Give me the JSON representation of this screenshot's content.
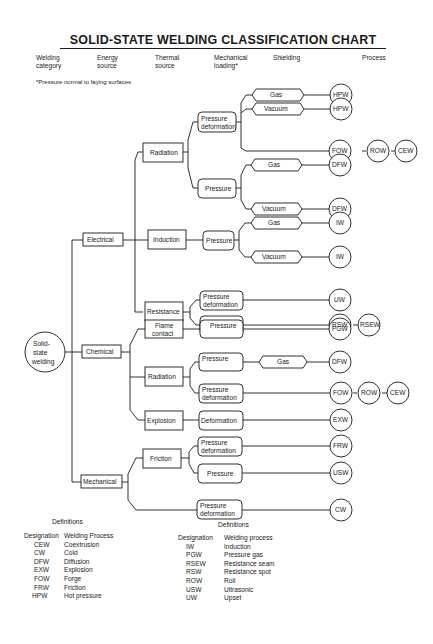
{
  "title": "SOLID-STATE WELDING CLASSIFICATION CHART",
  "column_headers": [
    {
      "line1": "Welding",
      "line2": "category"
    },
    {
      "line1": "Energy",
      "line2": "source"
    },
    {
      "line1": "Thermal",
      "line2": "source"
    },
    {
      "line1": "Mechanical",
      "line2": "loading*"
    },
    {
      "line1": "Shielding",
      "line2": ""
    },
    {
      "line1": "Process",
      "line2": ""
    }
  ],
  "footnote": "*Pressure normal to faying surfaces",
  "tree": {
    "root": {
      "line1": "Solid-",
      "line2": "state",
      "line3": "welding"
    },
    "categories": [
      "Electrical",
      "Chemical",
      "Mechanical"
    ],
    "sources": {
      "radiation": "Radiation",
      "induction": "Induction",
      "resistance": "Resistance",
      "flame_l1": "Flame",
      "flame_l2": "contact",
      "radiation2": "Radiation",
      "explosion": "Explosion",
      "friction": "Friction"
    },
    "loading": {
      "pd_l1": "Pressure",
      "pd_l2": "deformation",
      "pressure": "Pressure",
      "deformation": "Deformation"
    },
    "shielding": {
      "gas": "Gas",
      "vacuum": "Vacuum"
    },
    "processes": {
      "hpw": "HPW",
      "fow": "FOW",
      "row": "ROW",
      "cew": "CEW",
      "dfw": "DFW",
      "iw": "IW",
      "uw": "UW",
      "rsw": "RSW",
      "rsew": "RSEW",
      "pgw": "PGW",
      "exw": "EXW",
      "frw": "FRW",
      "usw": "USW",
      "cw": "CW"
    }
  },
  "definitions_left": {
    "title": "Definitions",
    "col1": "Designation",
    "col2": "Welding Process",
    "rows": [
      {
        "code": "CEW",
        "name": "Coextrusion"
      },
      {
        "code": "CW",
        "name": "Cold"
      },
      {
        "code": "DFW",
        "name": "Diffusion"
      },
      {
        "code": "EXW",
        "name": "Explosion"
      },
      {
        "code": "FOW",
        "name": "Forge"
      },
      {
        "code": "FRW",
        "name": "Friction"
      },
      {
        "code": "HPW",
        "name": "Hot pressure"
      }
    ]
  },
  "definitions_right": {
    "title": "Definitions",
    "col1": "Designation",
    "col2": "Welding process",
    "rows": [
      {
        "code": "IW",
        "name": "Induction"
      },
      {
        "code": "PGW",
        "name": "Pressure gas"
      },
      {
        "code": "RSEW",
        "name": "Resistance seam"
      },
      {
        "code": "RSW",
        "name": "Resistance spot"
      },
      {
        "code": "ROW",
        "name": "Roll"
      },
      {
        "code": "USW",
        "name": "Ultrasonic"
      },
      {
        "code": "UW",
        "name": "Upset"
      }
    ]
  }
}
